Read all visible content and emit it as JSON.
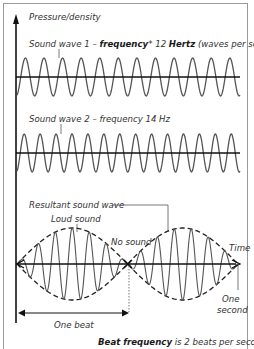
{
  "diagram": {
    "y_axis_label": "Pressure/density",
    "wave1": {
      "label_prefix": "Sound wave 1 – ",
      "label_bold1": "frequency",
      "label_mid": "* 12 ",
      "label_bold2": "Hertz",
      "label_suffix": " (waves per second)",
      "frequency_hz": 12
    },
    "wave2": {
      "label": "Sound wave 2 – frequency 14 Hz",
      "frequency_hz": 14
    },
    "resultant": {
      "label": "Resultant sound wave",
      "loud_label": "Loud sound",
      "no_sound_label": "No sound",
      "time_label": "Time",
      "one_second_label_1": "One",
      "one_second_label_2": "second",
      "one_beat_label": "One beat"
    },
    "footer": {
      "bold": "Beat frequency",
      "rest": " is 2 beats per second."
    },
    "colors": {
      "wave": "#555555",
      "axis": "#111111",
      "frame": "#9a9a9a"
    }
  }
}
